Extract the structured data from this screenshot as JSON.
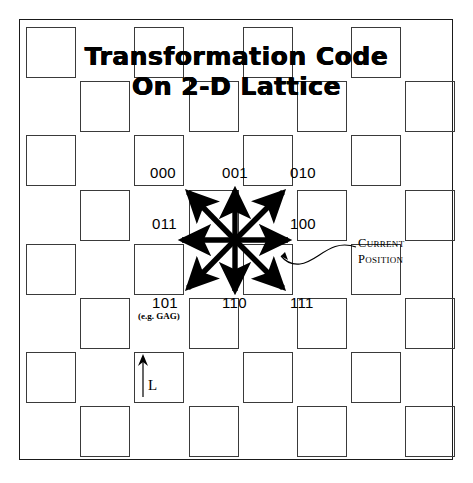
{
  "figure": {
    "title_line1": "Transformation Code",
    "title_line2": "On 2-D Lattice"
  },
  "lattice": {
    "rows": 8,
    "cols": 8,
    "cell_size_px": 50,
    "pattern": "checkerboard",
    "cell_stroke_color": "#3a3a3a",
    "frame_stroke_color": "#1a1a1a",
    "background_color": "#ffffff"
  },
  "codes": [
    {
      "id": "nw",
      "label": "000",
      "direction": "up-left",
      "sublabel": ""
    },
    {
      "id": "n",
      "label": "001",
      "direction": "up",
      "sublabel": ""
    },
    {
      "id": "ne",
      "label": "010",
      "direction": "up-right",
      "sublabel": ""
    },
    {
      "id": "w",
      "label": "011",
      "direction": "left",
      "sublabel": ""
    },
    {
      "id": "e",
      "label": "100",
      "direction": "right",
      "sublabel": ""
    },
    {
      "id": "sw",
      "label": "101",
      "direction": "down-left",
      "sublabel": "(e.g. GAG)"
    },
    {
      "id": "s",
      "label": "110",
      "direction": "down",
      "sublabel": ""
    },
    {
      "id": "se",
      "label": "111",
      "direction": "down-right",
      "sublabel": ""
    }
  ],
  "annotation": {
    "line1": "Current",
    "line2": "Position"
  },
  "scale": {
    "label": "L",
    "arrow": "up-arrow-icon"
  }
}
